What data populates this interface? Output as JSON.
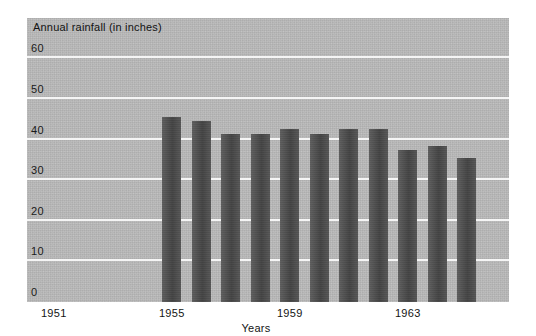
{
  "chart_data": {
    "type": "bar",
    "title": "Annual rainfall (in inches)",
    "xlabel": "Years",
    "ylabel": "",
    "ylim": [
      0,
      65
    ],
    "grid": true,
    "legend": "none",
    "yticks": [
      0,
      10,
      20,
      30,
      40,
      50,
      60
    ],
    "ytick_labels": [
      "0",
      "10",
      "20",
      "30",
      "40",
      "50",
      "60"
    ],
    "categories": [
      "1951",
      "1952",
      "1953",
      "1954",
      "1955",
      "1956",
      "1957",
      "1958",
      "1959",
      "1960",
      "1961",
      "1962",
      "1963",
      "1964",
      "1965"
    ],
    "xtick_labels_shown": [
      "1951",
      "1955",
      "1959",
      "1963"
    ],
    "values": [
      null,
      null,
      null,
      null,
      45,
      44,
      41,
      41,
      42,
      41,
      42,
      42,
      37,
      38,
      35
    ],
    "series": [
      {
        "name": "Annual rainfall",
        "values": [
          null,
          null,
          null,
          null,
          45,
          44,
          41,
          41,
          42,
          41,
          42,
          42,
          37,
          38,
          35
        ]
      }
    ]
  },
  "style": {
    "plot_background": "#b9b9b9",
    "bar_color": "#4b4b4b",
    "gridline_color": "#f5f5f5",
    "text_color": "#141414",
    "page_background": "#ffffff"
  }
}
